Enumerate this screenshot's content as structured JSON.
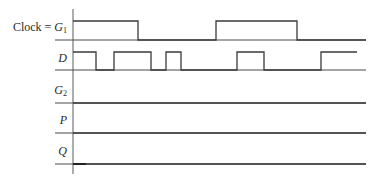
{
  "diagram": {
    "axis": {
      "x": 73,
      "y_top": 9,
      "y_bottom": 174
    },
    "x_end": 366,
    "signals": [
      {
        "id": "clock",
        "label_prefix": "Clock = ",
        "label_var": "G",
        "label_sub": "1",
        "label_x": 67,
        "label_y": 24,
        "high_y": 21,
        "low_y": 40,
        "baseline_start": 55,
        "waveform": [
          [
            73,
            "H"
          ],
          [
            138,
            "L"
          ],
          [
            216,
            "H"
          ],
          [
            297,
            "L"
          ]
        ],
        "end_x": 366
      },
      {
        "id": "D",
        "label_prefix": "",
        "label_var": "D",
        "label_sub": "",
        "label_x": 67,
        "label_y": 55,
        "high_y": 52,
        "low_y": 70,
        "baseline_start": 55,
        "waveform": [
          [
            73,
            "H"
          ],
          [
            96,
            "L"
          ],
          [
            114,
            "H"
          ],
          [
            151,
            "L"
          ],
          [
            166,
            "H"
          ],
          [
            181,
            "L"
          ],
          [
            237,
            "H"
          ],
          [
            264,
            "L"
          ],
          [
            321,
            "H"
          ]
        ],
        "end_x": 357,
        "baseline_end": 366
      },
      {
        "id": "G2",
        "label_prefix": "",
        "label_var": "G",
        "label_sub": "2",
        "label_x": 67,
        "label_y": 87,
        "low_y": 103,
        "baseline_start": 55,
        "waveform": [
          [
            73,
            "L"
          ]
        ],
        "end_x": 366
      },
      {
        "id": "P",
        "label_prefix": "",
        "label_var": "P",
        "label_sub": "",
        "label_x": 67,
        "label_y": 117,
        "low_y": 133,
        "baseline_start": 55,
        "waveform": [
          [
            73,
            "L"
          ]
        ],
        "end_x": 366
      },
      {
        "id": "Q",
        "label_prefix": "",
        "label_var": "Q",
        "label_sub": "",
        "label_x": 67,
        "label_y": 148,
        "low_y": 164,
        "baseline_start": 55,
        "waveform": [
          [
            73,
            "L"
          ]
        ],
        "end_x": 366,
        "initial_mark": [
          73,
          86
        ]
      }
    ],
    "colors": {
      "line": "#3a3a3a",
      "text": "#2a2a2a",
      "background": "#ffffff"
    }
  }
}
